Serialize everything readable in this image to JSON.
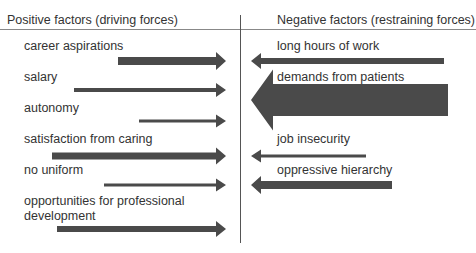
{
  "headers": {
    "positive": "Positive factors (driving forces)",
    "negative": "Negative factors (restraining forces)"
  },
  "positive_forces": [
    {
      "label": "career aspirations",
      "label_y": 39,
      "x1": 118,
      "x2": 226,
      "y": 61,
      "thickness": 8
    },
    {
      "label": "salary",
      "label_y": 70,
      "x1": 74,
      "x2": 226,
      "y": 90,
      "thickness": 4
    },
    {
      "label": "autonomy",
      "label_y": 101,
      "x1": 139,
      "x2": 226,
      "y": 121,
      "thickness": 3
    },
    {
      "label": "satisfaction from caring",
      "label_y": 132,
      "x1": 52,
      "x2": 226,
      "y": 156,
      "thickness": 7
    },
    {
      "label": "no uniform",
      "label_y": 163,
      "x1": 104,
      "x2": 226,
      "y": 185,
      "thickness": 3
    },
    {
      "label": "opportunities for professional",
      "label2": "development",
      "label_y": 194,
      "x1": 57,
      "x2": 226,
      "y": 229,
      "thickness": 6
    }
  ],
  "negative_forces": [
    {
      "label": "long hours of work",
      "label_y": 39,
      "x1": 444,
      "x2": 251,
      "y": 61,
      "thickness": 6
    },
    {
      "label": "demands from patients",
      "label_y": 70,
      "x1": 448,
      "x2": 251,
      "y": 100,
      "thickness": 32
    },
    {
      "label": "job insecurity",
      "label_y": 132,
      "x1": 366,
      "x2": 251,
      "y": 156,
      "thickness": 3
    },
    {
      "label": "oppressive hierarchy",
      "label_y": 163,
      "x1": 392,
      "x2": 251,
      "y": 185,
      "thickness": 8
    }
  ],
  "colors": {
    "arrow": "#4a4a4a",
    "text": "#333333",
    "divider": "#555555"
  }
}
